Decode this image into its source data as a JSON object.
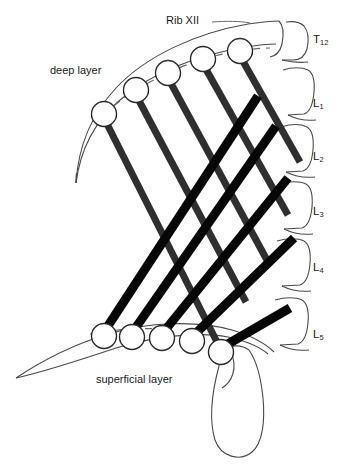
{
  "figure": {
    "title_visible": false,
    "background_color": "#ffffff",
    "ink_color": "#1b1b1b",
    "band_dark_color": "#0a0a0a",
    "band_mid_color": "#3a3a3a",
    "outline_color": "#4a4a4a"
  },
  "labels": {
    "rib": "Rib XII",
    "deep_layer": "deep layer",
    "superficial_layer": "superficial layer"
  },
  "vertebrae": [
    {
      "id": "T12",
      "letter": "T",
      "number": "12",
      "y": 40
    },
    {
      "id": "L1",
      "letter": "L",
      "number": "1",
      "y": 104
    },
    {
      "id": "L2",
      "letter": "L",
      "number": "2",
      "y": 157
    },
    {
      "id": "L3",
      "letter": "L",
      "number": "3",
      "y": 212
    },
    {
      "id": "L4",
      "letter": "L",
      "number": "4",
      "y": 268
    },
    {
      "id": "L5",
      "letter": "L",
      "number": "5",
      "y": 335
    }
  ],
  "deep_layer_attachments": [
    {
      "index": 1,
      "cx": 104,
      "cy": 114
    },
    {
      "index": 2,
      "cx": 136,
      "cy": 90
    },
    {
      "index": 3,
      "cx": 168,
      "cy": 73
    },
    {
      "index": 4,
      "cx": 203,
      "cy": 59
    },
    {
      "index": 5,
      "cx": 240,
      "cy": 51
    }
  ],
  "superficial_layer_attachments": [
    {
      "index": 1,
      "cx": 104,
      "cy": 336
    },
    {
      "index": 2,
      "cx": 132,
      "cy": 337
    },
    {
      "index": 3,
      "cx": 162,
      "cy": 338
    },
    {
      "index": 4,
      "cx": 192,
      "cy": 341
    },
    {
      "index": 5,
      "cx": 221,
      "cy": 352
    }
  ],
  "deep_bands_count": 5,
  "superficial_bands_count": 5,
  "structures": {
    "rib_xii": "twelfth rib outline",
    "iliac_crest": "iliac crest outline",
    "sacrum": "sacrum outline",
    "spine": "lumbar vertebral column outline"
  }
}
